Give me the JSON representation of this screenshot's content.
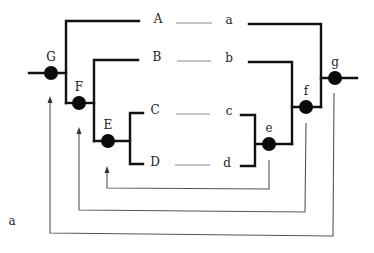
{
  "diagram": {
    "colors": {
      "stroke": "#111111",
      "thin": "#555555",
      "dash": "#8a8a8a",
      "node": "#0a0a0a",
      "background": "#ffffff"
    },
    "left_labels": [
      {
        "id": "A",
        "text": "A",
        "x": 158,
        "y": 23
      },
      {
        "id": "B",
        "text": "B",
        "x": 157,
        "y": 61
      },
      {
        "id": "C",
        "text": "C",
        "x": 155,
        "y": 114
      },
      {
        "id": "D",
        "text": "D",
        "x": 155,
        "y": 166
      }
    ],
    "right_labels": [
      {
        "id": "a",
        "text": "a",
        "x": 229,
        "y": 24
      },
      {
        "id": "b",
        "text": "b",
        "x": 229,
        "y": 62
      },
      {
        "id": "c",
        "text": "c",
        "x": 229,
        "y": 115
      },
      {
        "id": "d",
        "text": "d",
        "x": 227,
        "y": 167
      }
    ],
    "left_nodes": [
      {
        "id": "G",
        "label": "G",
        "cx": 51,
        "cy": 73,
        "label_x": 51,
        "label_y": 61
      },
      {
        "id": "F",
        "label": "F",
        "cx": 79,
        "cy": 103,
        "label_x": 79,
        "label_y": 91
      },
      {
        "id": "E",
        "label": "E",
        "cx": 108,
        "cy": 141,
        "label_x": 108,
        "label_y": 129
      }
    ],
    "right_nodes": [
      {
        "id": "g",
        "label": "g",
        "cx": 335,
        "cy": 78,
        "label_x": 335,
        "label_y": 66
      },
      {
        "id": "f",
        "label": "f",
        "cx": 306,
        "cy": 107,
        "label_x": 306,
        "label_y": 95
      },
      {
        "id": "e",
        "label": "e",
        "cx": 269,
        "cy": 144,
        "label_x": 269,
        "label_y": 132
      }
    ],
    "feedback_arrows": [
      {
        "from": "e",
        "to": "E",
        "path": "269,160 269,189 107,188 107,170"
      },
      {
        "from": "f",
        "to": "F",
        "path": "306,123 305,212 79,210 79,131"
      },
      {
        "from": "g",
        "to": "G",
        "path": "334,93 333,236 50,233 50,100"
      }
    ],
    "stray_label": {
      "text": "a",
      "x": 12,
      "y": 225
    }
  }
}
